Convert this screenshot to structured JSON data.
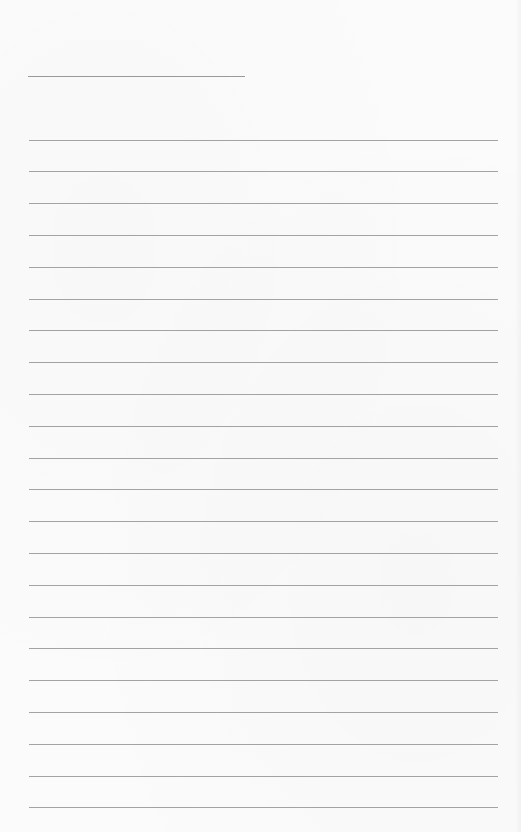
{
  "document": {
    "type": "lined-paper",
    "header_line": {
      "x": 28,
      "y": 76,
      "width": 217
    },
    "rules": {
      "count": 22,
      "first_y": 139.5,
      "spacing": 31.8,
      "x": 29,
      "width": 469
    },
    "colors": {
      "paper": "#fbfbfb",
      "rule": "#a3a3a3",
      "header_line": "#9a9a9a"
    }
  }
}
